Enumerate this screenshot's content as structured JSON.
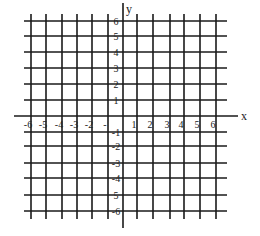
{
  "diagram": {
    "type": "coordinate-plane",
    "axes": {
      "x_label": "x",
      "y_label": "y"
    },
    "x_range": [
      -6,
      6
    ],
    "y_range": [
      -6,
      6
    ],
    "x_tick_labels": [
      "-6",
      "-5",
      "-4",
      "-3",
      "-2",
      "-",
      "1",
      "2",
      "3",
      "4",
      "5",
      "6"
    ],
    "y_tick_labels": [
      "6",
      "5",
      "4",
      "3",
      "2",
      "1",
      "-1",
      "-2",
      "-3",
      "-4",
      "5",
      "-6"
    ],
    "grid": true,
    "colors": {
      "line": "#1a1a1a",
      "background": "#ffffff"
    }
  }
}
